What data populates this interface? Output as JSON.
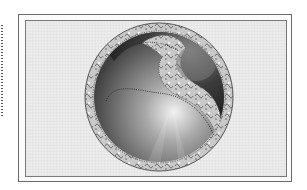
{
  "image": {
    "description": "Framed grayscale yin-yang style emblem with ornate scrollwork border on a light textured background",
    "subject": "ornate-yin-yang-emblem",
    "colors": {
      "page_background": "#ffffff",
      "frame_fill": "#ececec",
      "frame_border": "#6a6a6a",
      "dark_half": "#3a3a3a",
      "light_half": "#b8b8b8",
      "ornament": "#d4d4d4"
    }
  }
}
